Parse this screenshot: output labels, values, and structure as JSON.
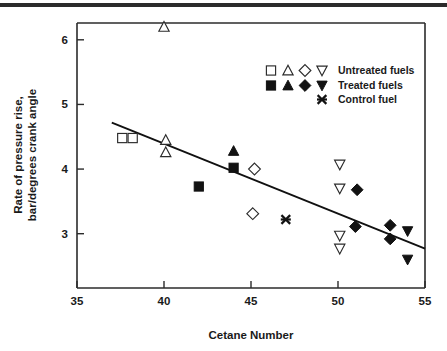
{
  "figure": {
    "has_top_rule": true,
    "background_color": "#ffffff",
    "ink_color": "#1a1a1a"
  },
  "chart_data": {
    "type": "scatter",
    "title": "",
    "xlabel": "Cetane Number",
    "ylabel": "Rate of pressure rise,\nbar/degrees crank angle",
    "ylabel_line1": "Rate of pressure rise,",
    "ylabel_line2": "bar/degrees crank angle",
    "xlim": [
      35,
      55
    ],
    "ylim": [
      2.16,
      6.26
    ],
    "xticks": [
      35,
      40,
      45,
      50,
      55
    ],
    "xticklabels": [
      "35",
      "40",
      "45",
      "50",
      "55"
    ],
    "yticks": [
      3,
      4,
      5,
      6
    ],
    "yticklabels": [
      "3",
      "4",
      "5",
      "6"
    ],
    "grid": false,
    "legend_position": "upper right",
    "series": [
      {
        "name": "Untreated fuels",
        "marker": "open-square",
        "filled": false,
        "points": [
          {
            "x": 37.6,
            "y": 4.48
          },
          {
            "x": 38.2,
            "y": 4.48
          }
        ]
      },
      {
        "name": "Untreated fuels",
        "marker": "open-triangle-up",
        "filled": false,
        "points": [
          {
            "x": 40.0,
            "y": 6.2
          },
          {
            "x": 40.1,
            "y": 4.45
          },
          {
            "x": 40.1,
            "y": 4.26
          }
        ]
      },
      {
        "name": "Untreated fuels",
        "marker": "open-diamond",
        "filled": false,
        "points": [
          {
            "x": 45.2,
            "y": 4.0
          },
          {
            "x": 45.1,
            "y": 3.31
          }
        ]
      },
      {
        "name": "Untreated fuels",
        "marker": "open-triangle-down",
        "filled": false,
        "points": [
          {
            "x": 50.1,
            "y": 4.07
          },
          {
            "x": 50.1,
            "y": 3.7
          },
          {
            "x": 50.1,
            "y": 2.97
          },
          {
            "x": 50.1,
            "y": 2.77
          }
        ]
      },
      {
        "name": "Treated fuels",
        "marker": "filled-square",
        "filled": true,
        "points": [
          {
            "x": 42.0,
            "y": 3.73
          },
          {
            "x": 44.0,
            "y": 4.02
          }
        ]
      },
      {
        "name": "Treated fuels",
        "marker": "filled-triangle-up",
        "filled": true,
        "points": [
          {
            "x": 44.0,
            "y": 4.28
          }
        ]
      },
      {
        "name": "Treated fuels",
        "marker": "filled-diamond",
        "filled": true,
        "points": [
          {
            "x": 51.1,
            "y": 3.68
          },
          {
            "x": 51.0,
            "y": 3.11
          },
          {
            "x": 53.0,
            "y": 3.13
          },
          {
            "x": 53.0,
            "y": 2.92
          }
        ]
      },
      {
        "name": "Treated fuels",
        "marker": "filled-triangle-down",
        "filled": true,
        "points": [
          {
            "x": 54.0,
            "y": 3.04
          },
          {
            "x": 54.0,
            "y": 2.6
          }
        ]
      },
      {
        "name": "Control fuel",
        "marker": "x-cross",
        "filled": true,
        "points": [
          {
            "x": 47.0,
            "y": 3.22
          }
        ]
      }
    ],
    "trendline": {
      "x_start": 37.0,
      "y_start": 4.72,
      "x_end": 55.0,
      "y_end": 2.77
    }
  },
  "legend": {
    "rows": [
      {
        "label": "Untreated fuels",
        "markers": [
          "open-square",
          "open-triangle-up",
          "open-diamond",
          "open-triangle-down"
        ]
      },
      {
        "label": "Treated fuels",
        "markers": [
          "filled-square",
          "filled-triangle-up",
          "filled-diamond",
          "filled-triangle-down"
        ]
      },
      {
        "label": "Control fuel",
        "markers": [
          "x-cross"
        ]
      }
    ]
  }
}
